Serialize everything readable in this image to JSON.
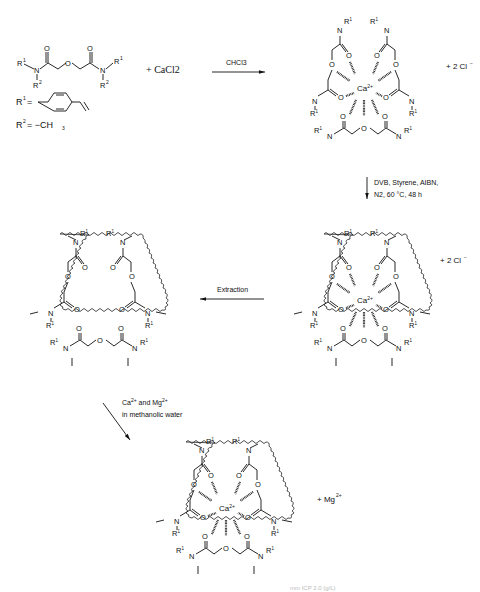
{
  "figure": {
    "type": "reaction-scheme"
  },
  "reactants": {
    "ligand_substituent_left_top": "R1",
    "ligand_substituent_left_bottom": "R2",
    "ligand_substituent_right_top": "R1",
    "ligand_substituent_right_bottom": "R2",
    "plus_salt": "+ CaCl2",
    "r1_definition_label": "R1 =",
    "r1_group": "4-vinylphenyl",
    "r2_definition_label": "R2 = −CH3"
  },
  "steps": [
    {
      "id": "complexation",
      "condition": "CHCl3",
      "direction": "right"
    },
    {
      "id": "polymerization",
      "condition_line1": "DVB, Styrene, AIBN,",
      "condition_line2": "N2, 60 °C, 48 h",
      "direction": "down"
    },
    {
      "id": "extraction",
      "condition": "Extraction",
      "direction": "left"
    },
    {
      "id": "rebinding",
      "condition_line1": "Ca2+ and Mg2+",
      "condition_line2": "in methanolic water",
      "direction": "down-right"
    }
  ],
  "products": {
    "complex": {
      "center": "Ca2+",
      "counter_ion": "+ 2 Cl⁻"
    },
    "imprinted_polymer_with_ca": {
      "center": "Ca2+",
      "counter_ion": "+ 2 Cl⁻"
    },
    "imprinted_polymer_empty": {
      "center": ""
    },
    "rebound_polymer": {
      "center": "Ca2+",
      "byproduct": "+ Mg2+"
    }
  },
  "atoms": {
    "N": "N",
    "O": "O",
    "R1": "R¹",
    "R2": "R²"
  },
  "caption_fragment": "... ICP ... 2.0 ... (g/L) ..."
}
